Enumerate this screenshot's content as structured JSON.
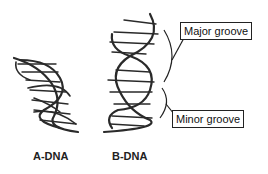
{
  "diagram": {
    "structures": [
      {
        "name": "A-DNA",
        "label": "A-DNA"
      },
      {
        "name": "B-DNA",
        "label": "B-DNA"
      }
    ],
    "callouts": {
      "major": "Major groove",
      "minor": "Minor groove"
    },
    "colors": {
      "ink": "#2a2a2a",
      "background": "#ffffff"
    }
  }
}
